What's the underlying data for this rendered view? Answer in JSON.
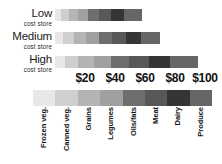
{
  "chart_data": {
    "type": "bar",
    "orientation": "horizontal",
    "stacked": true,
    "title": "",
    "xlabel": "",
    "ylabel": "",
    "xlim": [
      0,
      110
    ],
    "grid": false,
    "legend_position": "bottom",
    "categories": [
      "Low cost store",
      "Medium cost store",
      "High cost store"
    ],
    "tick_labels": [
      "$20",
      "$40",
      "$60",
      "$80",
      "$100"
    ],
    "tick_values": [
      20,
      40,
      60,
      80,
      100
    ],
    "series": [
      {
        "name": "Frozen veg.",
        "color": "#e8e8e8",
        "values": [
          4.0,
          5.0,
          6.5
        ]
      },
      {
        "name": "Canned veg.",
        "color": "#cfcfcf",
        "values": [
          5.5,
          7.5,
          9.0
        ]
      },
      {
        "name": "Grains",
        "color": "#b4b4b4",
        "values": [
          6.0,
          8.0,
          10.5
        ]
      },
      {
        "name": "Legumes",
        "color": "#a0a0a0",
        "values": [
          6.5,
          8.5,
          11.0
        ]
      },
      {
        "name": "Oils/fats",
        "color": "#6e6e6e",
        "values": [
          7.5,
          9.0,
          12.5
        ]
      },
      {
        "name": "Meat",
        "color": "#585858",
        "values": [
          8.0,
          9.5,
          13.0
        ]
      },
      {
        "name": "Dairy",
        "color": "#353535",
        "values": [
          8.5,
          10.0,
          14.0
        ]
      },
      {
        "name": "Produce",
        "color": "#666666",
        "values": [
          12.0,
          12.5,
          18.5
        ]
      }
    ],
    "totals": [
      58,
      70,
      95
    ]
  },
  "rows": [
    {
      "title": "Low",
      "subtitle": "cost store"
    },
    {
      "title": "Medium",
      "subtitle": "cost store"
    },
    {
      "title": "High",
      "subtitle": "cost store"
    }
  ],
  "axis": {
    "ticks": [
      "$20",
      "$40",
      "$60",
      "$80",
      "$100"
    ]
  },
  "legend": {
    "items": [
      "Frozen veg.",
      "Canned veg.",
      "Grains",
      "Legumes",
      "Oils/fats",
      "Meat",
      "Dairy",
      "Produce"
    ]
  }
}
